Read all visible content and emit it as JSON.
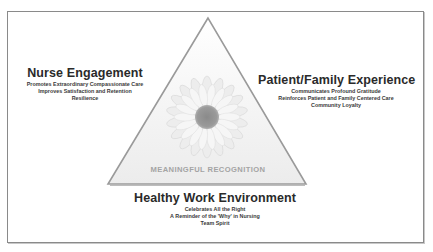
{
  "diagram": {
    "center_label": "MEANINGFUL RECOGNITION",
    "center_image": "daisy-flower-icon",
    "colors": {
      "frame_border": "#8a8a8a",
      "triangle_edge": "#9a9a9a",
      "triangle_fill": "#f4f4f4",
      "petal": "#ececec",
      "flower_center": "#8f8f8f",
      "label_text": "#a4a4a4",
      "heading_text": "#2a2a2a"
    }
  },
  "nurse_engagement": {
    "title": "Nurse Engagement",
    "items": [
      "Promotes Extraordinary Compassionate Care",
      "Improves Satisfaction and Retention",
      "Resilience"
    ]
  },
  "patient_family_experience": {
    "title": "Patient/Family Experience",
    "items": [
      "Communicates Profound Gratitude",
      "Reinforces Patient and Family Centered Care",
      "Community Loyalty"
    ]
  },
  "healthy_work_environment": {
    "title": "Healthy Work Environment",
    "items": [
      "Celebrates All the Right",
      "A Reminder of the 'Why' in Nursing",
      "Team Spirit"
    ]
  }
}
